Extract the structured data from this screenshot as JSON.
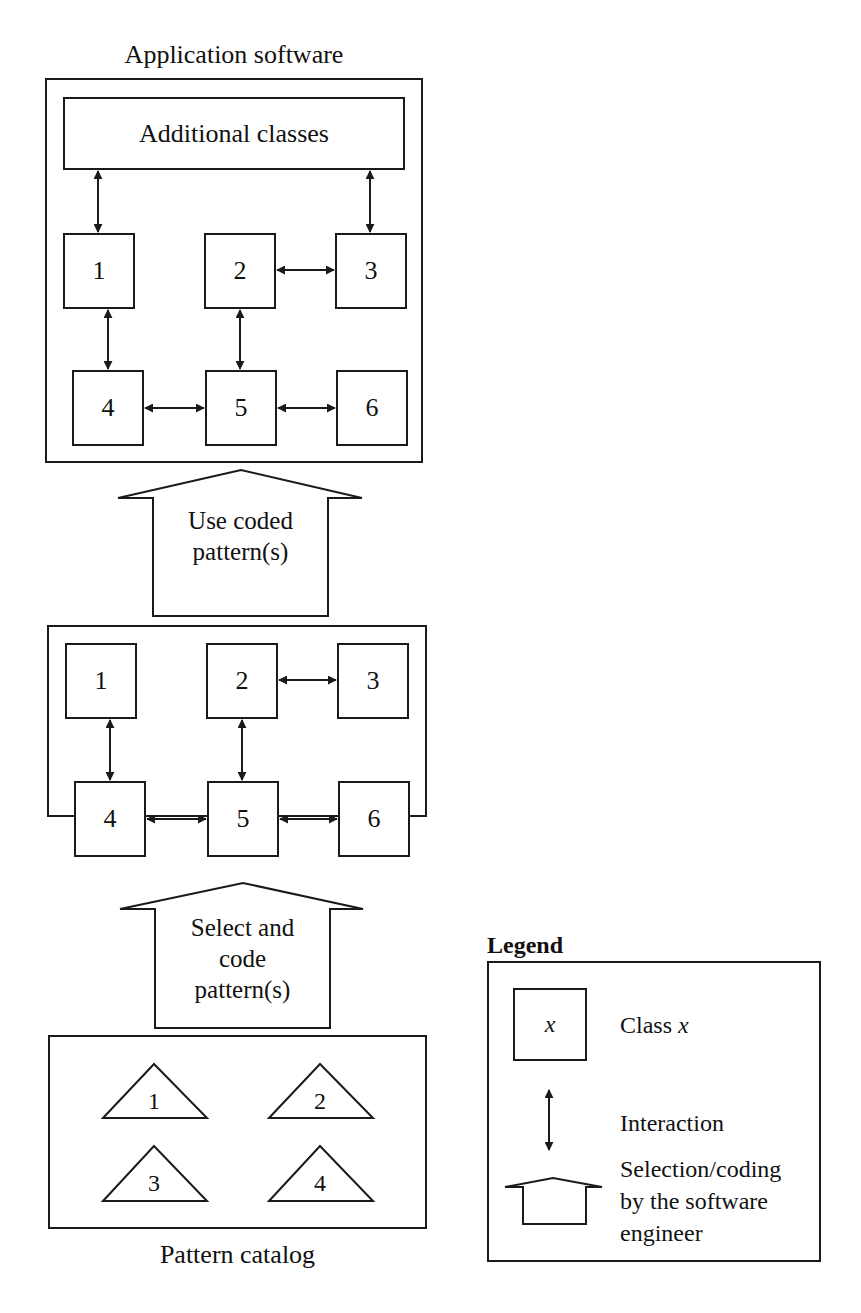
{
  "application_software": {
    "title": "Application software",
    "additional_classes": "Additional classes",
    "classes": [
      "1",
      "2",
      "3",
      "4",
      "5",
      "6"
    ]
  },
  "use_arrow": {
    "line1": "Use coded",
    "line2": "pattern(s)"
  },
  "coded_pattern": {
    "classes": [
      "1",
      "2",
      "3",
      "4",
      "5",
      "6"
    ]
  },
  "select_arrow": {
    "line1": "Select and",
    "line2": "code",
    "line3": "pattern(s)"
  },
  "pattern_catalog": {
    "title": "Pattern catalog",
    "patterns": [
      "1",
      "2",
      "3",
      "4"
    ]
  },
  "legend": {
    "title": "Legend",
    "class_symbol": "x",
    "class_label_prefix": "Class ",
    "class_label_var": "x",
    "interaction_label": "Interaction",
    "selection_line1": "Selection/coding",
    "selection_line2": "by the software",
    "selection_line3": "engineer"
  },
  "colors": {
    "stroke": "#1a1a1a",
    "background": "#ffffff"
  }
}
